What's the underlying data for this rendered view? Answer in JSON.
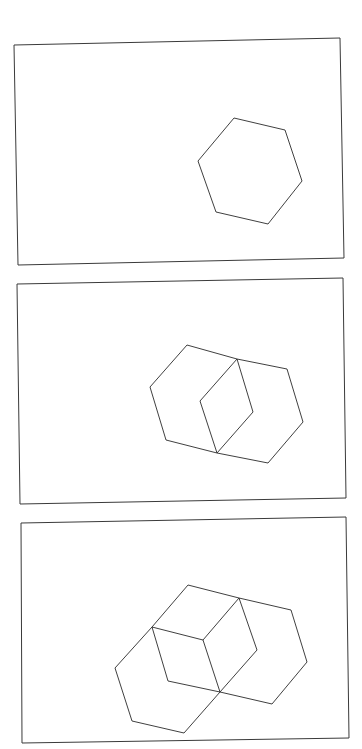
{
  "figure": {
    "stroke_color": "#2a2a2a",
    "background": "#ffffff",
    "panels": [
      {
        "id": "step-1",
        "frame": [
          [
            14,
            45
          ],
          [
            340,
            38
          ],
          [
            344,
            258
          ],
          [
            18,
            265
          ]
        ],
        "polylines": [
          [
            [
              234,
              118
            ],
            [
              285,
              130
            ],
            [
              302,
              181
            ],
            [
              268,
              224
            ],
            [
              216,
              212
            ],
            [
              198,
              161
            ],
            [
              234,
              118
            ]
          ]
        ]
      },
      {
        "id": "step-2",
        "frame": [
          [
            17,
            284
          ],
          [
            343,
            278
          ],
          [
            346,
            498
          ],
          [
            20,
            504
          ]
        ],
        "polylines": [
          [
            [
              237,
              359
            ],
            [
              187,
              345
            ],
            [
              150,
              387
            ],
            [
              166,
              440
            ],
            [
              217,
              453
            ]
          ],
          [
            [
              237,
              359
            ],
            [
              287,
              369
            ],
            [
              303,
              422
            ],
            [
              268,
              463
            ],
            [
              217,
              453
            ]
          ],
          [
            [
              237,
              359
            ],
            [
              200,
              401
            ],
            [
              217,
              453
            ]
          ],
          [
            [
              237,
              359
            ],
            [
              253,
              412
            ],
            [
              217,
              453
            ]
          ]
        ]
      },
      {
        "id": "step-3",
        "frame": [
          [
            21,
            523
          ],
          [
            346,
            517
          ],
          [
            349,
            738
          ],
          [
            22,
            743
          ]
        ],
        "polylines": [
          [
            [
              152,
              627
            ],
            [
              188,
              585
            ],
            [
              239,
              598
            ],
            [
              291,
              610
            ],
            [
              307,
              662
            ],
            [
              272,
              704
            ],
            [
              220,
              692
            ]
          ],
          [
            [
              152,
              627
            ],
            [
              203,
              640
            ],
            [
              239,
              598
            ]
          ],
          [
            [
              239,
              598
            ],
            [
              257,
              650
            ],
            [
              220,
              692
            ]
          ],
          [
            [
              203,
              640
            ],
            [
              220,
              692
            ]
          ],
          [
            [
              152,
              627
            ],
            [
              168,
              681
            ],
            [
              220,
              692
            ]
          ],
          [
            [
              152,
              627
            ],
            [
              115,
              668
            ],
            [
              132,
              721
            ],
            [
              184,
              733
            ],
            [
              220,
              692
            ]
          ]
        ]
      }
    ]
  }
}
